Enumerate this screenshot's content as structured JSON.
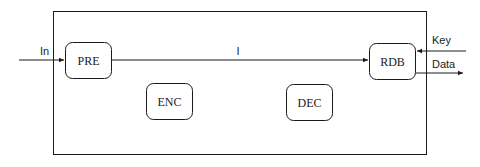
{
  "diagram": {
    "blocks": {
      "pre": "PRE",
      "enc": "ENC",
      "dec": "DEC",
      "rdb": "RDB"
    },
    "signals": {
      "input": "In",
      "internal": "I",
      "key": "Key",
      "data": "Data"
    },
    "colors": {
      "stroke": "#1a1a1a",
      "background": "#ffffff"
    }
  }
}
